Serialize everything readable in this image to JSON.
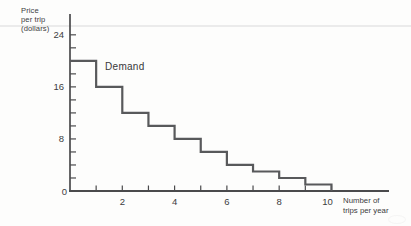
{
  "labels": {
    "y_axis_lines": [
      "Price",
      "per trip",
      "(dollars)"
    ],
    "demand": "Demand",
    "x_axis_lines": [
      "Number of",
      "trips per year"
    ]
  },
  "chart_data": {
    "type": "line",
    "line_style": "step",
    "title": "",
    "ylabel": "Price per trip (dollars)",
    "xlabel": "Number of trips per year",
    "series": [
      {
        "name": "Demand",
        "points_trip_price": [
          [
            1,
            20
          ],
          [
            2,
            16
          ],
          [
            3,
            12
          ],
          [
            4,
            10
          ],
          [
            5,
            8
          ],
          [
            6,
            6
          ],
          [
            7,
            4
          ],
          [
            8,
            3
          ],
          [
            9,
            2
          ],
          [
            10,
            1
          ]
        ]
      }
    ],
    "xlim": [
      0,
      12.2
    ],
    "ylim": [
      0,
      27.2
    ],
    "grid": false,
    "legend": "none (inline series label near curve start)",
    "x_minor_ticks": [
      1,
      2,
      3,
      4,
      5,
      6,
      7,
      8,
      9,
      10
    ],
    "x_tick_labels": [
      {
        "value": 2,
        "label": "2"
      },
      {
        "value": 4,
        "label": "4"
      },
      {
        "value": 6,
        "label": "6"
      },
      {
        "value": 8,
        "label": "8"
      },
      {
        "value": 10,
        "label": "10"
      }
    ],
    "y_minor_ticks": [
      2,
      4,
      6,
      8,
      10,
      12,
      14,
      16,
      18,
      20,
      22,
      24
    ],
    "y_tick_labels": [
      {
        "value": 0,
        "label": "0"
      },
      {
        "value": 8,
        "label": "8"
      },
      {
        "value": 16,
        "label": "16"
      },
      {
        "value": 24,
        "label": "24"
      }
    ],
    "colors": {
      "curve": "#58595b",
      "axis": "#4a4a4c",
      "text": "#3c3c3e",
      "rule_line": "#ebebeb",
      "background": "#fdfdfc"
    }
  }
}
